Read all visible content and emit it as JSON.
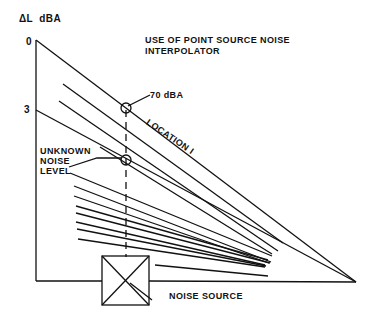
{
  "title": {
    "line1": "USE OF POINT SOURCE NOISE",
    "line2": "INTERPOLATOR"
  },
  "axis": {
    "label": "ΔL  dBA",
    "tick_0": "0",
    "tick_3": "3"
  },
  "annotations": {
    "known_level": "70 dBA",
    "location": "LOCATION I",
    "unknown_line1": "UNKNOWN",
    "unknown_line2": "NOISE",
    "unknown_line3": "LEVEL",
    "source": "NOISE SOURCE"
  },
  "colors": {
    "ink": "#111111",
    "background": "#ffffff"
  }
}
